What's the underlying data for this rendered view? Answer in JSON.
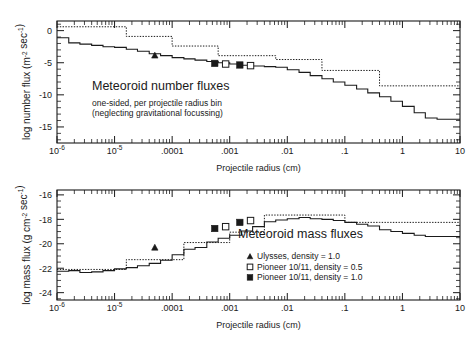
{
  "figure": {
    "width": 475,
    "height": 339,
    "background": "#ffffff",
    "ink": "#1a1a1a"
  },
  "chart_data": [
    {
      "type": "line",
      "id": "number-flux",
      "title": "Meteoroid number fluxes",
      "subtitle_line1": "one-sided, per projectile radius bin",
      "subtitle_line2": "(neglecting gravitational focussing)",
      "xlabel": "Projectile radius (cm)",
      "ylabel": "log number flux (m⁻² sec⁻¹)",
      "xscale": "log",
      "xlim": [
        1e-06,
        10
      ],
      "ylim": [
        -17.5,
        1.5
      ],
      "yticks": [
        0,
        -5,
        -10,
        -15
      ],
      "yticklabels": [
        "0",
        "-5",
        "-10",
        "-15"
      ],
      "xticklabels": [
        "10⁻⁶",
        "10⁻⁵",
        ".0001",
        ".001",
        ".01",
        ".1",
        "1",
        "10"
      ],
      "grid": false,
      "legend_position": "none",
      "series": [
        {
          "name": "model-solid",
          "style": "solid",
          "note": "descending staircase of number flux vs radius",
          "x": [
            1e-06,
            1.6e-06,
            2.5e-06,
            4e-06,
            6.3e-06,
            1e-05,
            1.6e-05,
            2.5e-05,
            4e-05,
            6.3e-05,
            0.0001,
            0.00016,
            0.00025,
            0.0004,
            0.00063,
            0.001,
            0.0016,
            0.0025,
            0.004,
            0.0063,
            0.01,
            0.016,
            0.025,
            0.04,
            0.063,
            0.1,
            0.16,
            0.25,
            0.4,
            0.63,
            1.0,
            1.6,
            2.5,
            4.0
          ],
          "y": [
            -1.1,
            -1.9,
            -2.1,
            -2.3,
            -2.5,
            -2.6,
            -2.9,
            -3.2,
            -3.6,
            -3.9,
            -4.2,
            -4.4,
            -4.6,
            -4.8,
            -5.0,
            -5.2,
            -5.4,
            -5.5,
            -5.6,
            -5.7,
            -6.1,
            -6.5,
            -7.0,
            -7.5,
            -8.0,
            -8.5,
            -9.1,
            -9.7,
            -10.3,
            -11.0,
            -11.8,
            -12.8,
            -13.6,
            -13.8
          ]
        },
        {
          "name": "model-dotted",
          "style": "dotted",
          "note": "upper-envelope staircase",
          "x": [
            1e-06,
            1.6e-06,
            2.5e-06,
            4e-06,
            6.3e-06,
            1e-05,
            1.6e-05,
            2.5e-05,
            4e-05,
            6.3e-05,
            0.0001,
            0.00016,
            0.00025,
            0.0004,
            0.00063,
            0.001,
            0.0016,
            0.0025,
            0.004,
            0.0063,
            0.01,
            0.016,
            0.025,
            0.04,
            0.063,
            0.1,
            0.16,
            0.25,
            0.4,
            0.63
          ],
          "y": [
            0.6,
            0.6,
            0.6,
            0.6,
            0.6,
            0.6,
            -0.9,
            -0.9,
            -0.9,
            -0.9,
            -2.4,
            -2.4,
            -2.4,
            -2.4,
            -3.9,
            -3.9,
            -3.9,
            -3.9,
            -3.9,
            -4.5,
            -4.5,
            -4.5,
            -4.5,
            -6.2,
            -6.2,
            -6.2,
            -6.2,
            -6.2,
            -8.6,
            -8.6
          ]
        }
      ],
      "markers": [
        {
          "symbol": "triangle-filled",
          "x": 5e-05,
          "y": -3.85
        },
        {
          "symbol": "square-filled",
          "x": 0.00055,
          "y": -5.1
        },
        {
          "symbol": "square-open",
          "x": 0.00085,
          "y": -5.2
        },
        {
          "symbol": "square-filled",
          "x": 0.0015,
          "y": -5.35
        },
        {
          "symbol": "square-open",
          "x": 0.0023,
          "y": -5.45
        }
      ]
    },
    {
      "type": "line",
      "id": "mass-flux",
      "title": "Meteoroid mass fluxes",
      "xlabel": "Projectile radius (cm)",
      "ylabel": "log mass flux (g cm⁻² sec⁻¹)",
      "xscale": "log",
      "xlim": [
        1e-06,
        10
      ],
      "ylim": [
        -24.6,
        -15.6
      ],
      "yticks": [
        -16,
        -18,
        -20,
        -22,
        -24
      ],
      "yticklabels": [
        "-16",
        "-18",
        "-20",
        "-22",
        "-24"
      ],
      "xticklabels": [
        "10⁻⁶",
        "10⁻⁵",
        ".0001",
        ".001",
        ".01",
        ".1",
        "1",
        "10"
      ],
      "grid": false,
      "legend_position": "inside-lower-right",
      "series": [
        {
          "name": "model-solid",
          "style": "solid",
          "note": "rising then falling staircase of mass flux vs radius, peak near 0.01 cm",
          "x": [
            1e-06,
            1.6e-06,
            2.5e-06,
            4e-06,
            6.3e-06,
            1e-05,
            1.6e-05,
            2.5e-05,
            4e-05,
            6.3e-05,
            0.0001,
            0.00016,
            0.00025,
            0.0004,
            0.00063,
            0.001,
            0.0016,
            0.0025,
            0.004,
            0.0063,
            0.01,
            0.016,
            0.025,
            0.04,
            0.063,
            0.1,
            0.16,
            0.25,
            0.4,
            0.63,
            1.0,
            1.6,
            2.5,
            4.0
          ],
          "y": [
            -22.25,
            -22.2,
            -22.35,
            -22.3,
            -22.2,
            -22.05,
            -21.95,
            -21.8,
            -21.6,
            -21.35,
            -20.9,
            -20.45,
            -20.3,
            -19.85,
            -19.55,
            -19.3,
            -18.95,
            -18.6,
            -18.2,
            -18.05,
            -17.95,
            -17.85,
            -17.95,
            -18.0,
            -18.1,
            -18.25,
            -18.4,
            -18.55,
            -18.85,
            -19.0,
            -19.15,
            -19.3,
            -19.4,
            -19.4
          ]
        },
        {
          "name": "model-dotted",
          "style": "dotted",
          "note": "upper-envelope staircase",
          "x": [
            1e-06,
            1.6e-06,
            2.5e-06,
            4e-06,
            6.3e-06,
            1e-05,
            1.6e-05,
            2.5e-05,
            4e-05,
            6.3e-05,
            0.0001,
            0.00016,
            0.00025,
            0.0004,
            0.00063,
            0.001,
            0.0016,
            0.0025,
            0.004,
            0.0063,
            0.01,
            0.016,
            0.025,
            0.04,
            0.063,
            0.1,
            0.16,
            0.25,
            0.4,
            0.63,
            1.0,
            1.6,
            2.5,
            4.0
          ],
          "y": [
            -22.1,
            -22.1,
            -22.1,
            -22.1,
            -22.1,
            -22.1,
            -21.3,
            -21.3,
            -21.3,
            -21.3,
            -21.3,
            -19.9,
            -19.9,
            -19.9,
            -19.9,
            -19.05,
            -19.05,
            -19.05,
            -17.65,
            -17.65,
            -17.65,
            -17.65,
            -17.65,
            -17.65,
            -17.65,
            -18.25,
            -18.25,
            -18.25,
            -18.25,
            -18.25,
            -18.25,
            -18.25,
            -18.25,
            -18.25
          ]
        }
      ],
      "markers": [
        {
          "symbol": "triangle-filled",
          "x": 5e-05,
          "y": -20.3
        },
        {
          "symbol": "square-filled",
          "x": 0.00055,
          "y": -18.75
        },
        {
          "symbol": "square-open",
          "x": 0.00085,
          "y": -18.6
        },
        {
          "symbol": "square-filled",
          "x": 0.0015,
          "y": -18.25
        },
        {
          "symbol": "square-open",
          "x": 0.0023,
          "y": -18.1
        }
      ],
      "legend": [
        {
          "symbol": "triangle-filled",
          "label": "Ulysses, density = 1.0"
        },
        {
          "symbol": "square-open",
          "label": "Pioneer 10/11, density = 0.5"
        },
        {
          "symbol": "square-filled",
          "label": "Pioneer 10/11, density = 1.0"
        }
      ]
    }
  ]
}
